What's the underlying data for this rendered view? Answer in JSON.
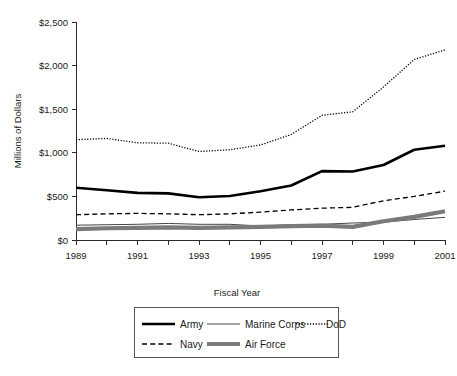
{
  "chart_data": {
    "type": "line",
    "title": "",
    "xlabel": "Fiscal Year",
    "ylabel": "Millions of Dollars",
    "xlim": [
      1989,
      2001
    ],
    "ylim": [
      0,
      2500
    ],
    "grid": false,
    "legend_position": "bottom",
    "x": [
      1989,
      1990,
      1991,
      1992,
      1993,
      1994,
      1995,
      1996,
      1997,
      1998,
      1999,
      2000,
      2001
    ],
    "x_tick_labels": [
      "1989",
      "1991",
      "1993",
      "1995",
      "1997",
      "1999",
      "2001"
    ],
    "y_tick_labels": [
      "$0",
      "$500",
      "$1,000",
      "$1,500",
      "$2,000",
      "$2,500"
    ],
    "y_tick_values": [
      0,
      500,
      1000,
      1500,
      2000,
      2500
    ],
    "series": [
      {
        "name": "Army",
        "style": "thick-solid",
        "color": "#000000",
        "values": [
          600,
          570,
          540,
          535,
          490,
          505,
          560,
          625,
          790,
          785,
          860,
          1035,
          1080
        ]
      },
      {
        "name": "Marine Corps",
        "style": "thin-solid",
        "color": "#444444",
        "values": [
          170,
          175,
          180,
          190,
          180,
          180,
          160,
          175,
          180,
          195,
          205,
          235,
          260
        ]
      },
      {
        "name": "DoD",
        "style": "dotted",
        "color": "#000000",
        "values": [
          1150,
          1165,
          1115,
          1110,
          1015,
          1035,
          1090,
          1210,
          1430,
          1470,
          1755,
          2070,
          2180
        ]
      },
      {
        "name": "Navy",
        "style": "dashed",
        "color": "#000000",
        "values": [
          290,
          300,
          305,
          300,
          290,
          300,
          320,
          345,
          365,
          375,
          450,
          500,
          560
        ]
      },
      {
        "name": "Air Force",
        "style": "thick-gray",
        "color": "#7a7a7a",
        "values": [
          125,
          135,
          140,
          145,
          140,
          145,
          150,
          160,
          165,
          150,
          215,
          265,
          330
        ]
      }
    ]
  },
  "axes": {
    "y_title": "Millions of Dollars",
    "x_title": "Fiscal Year"
  },
  "legend": {
    "items": [
      {
        "label": "Army",
        "key": "army"
      },
      {
        "label": "Marine Corps",
        "key": "marine-corps"
      },
      {
        "label": "DoD",
        "key": "dod"
      },
      {
        "label": "Navy",
        "key": "navy"
      },
      {
        "label": "Air Force",
        "key": "air-force"
      }
    ]
  },
  "footer": {
    "ghost_text": ""
  }
}
